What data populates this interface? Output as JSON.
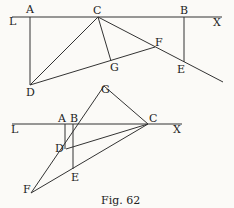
{
  "figure": {
    "caption": "Fig. 62",
    "top": {
      "labels": {
        "L": "L",
        "A": "A",
        "C": "C",
        "B": "B",
        "X": "X",
        "F": "F",
        "G": "G",
        "E": "E",
        "D": "D"
      }
    },
    "bottom": {
      "labels": {
        "G": "G",
        "L": "L",
        "A": "A",
        "B": "B",
        "C": "C",
        "X": "X",
        "D": "D",
        "E": "E",
        "F": "F"
      }
    }
  }
}
